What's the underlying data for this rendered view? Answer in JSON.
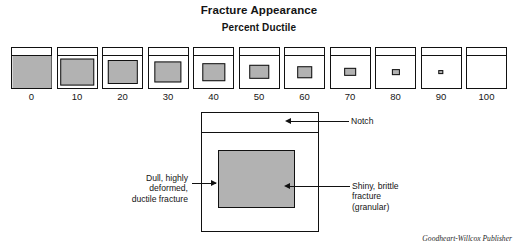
{
  "figure": {
    "main_title": "Fracture Appearance",
    "sub_title": "Percent Ductile",
    "credit": "Goodheart-Willcox Publisher"
  },
  "chart_data": {
    "type": "table",
    "title": "Fracture Appearance",
    "subtitle": "Percent Ductile",
    "xlabel": "Percent Ductile",
    "ylabel": "",
    "grid": false,
    "legend": "none",
    "categories": [
      "0",
      "10",
      "20",
      "30",
      "40",
      "50",
      "60",
      "70",
      "80",
      "90",
      "100"
    ],
    "values": [
      0,
      10,
      20,
      30,
      40,
      50,
      60,
      70,
      80,
      90,
      100
    ],
    "series": [
      {
        "name": "Brittle (shiny, granular) fracture area fraction",
        "values": [
          100,
          90,
          80,
          70,
          60,
          50,
          40,
          30,
          20,
          10,
          0
        ]
      },
      {
        "name": "Ductile (dull, deformed) fracture area fraction",
        "values": [
          0,
          10,
          20,
          30,
          40,
          50,
          60,
          70,
          80,
          90,
          100
        ]
      }
    ]
  },
  "scale": {
    "tick_labels": [
      "0",
      "10",
      "20",
      "30",
      "40",
      "50",
      "60",
      "70",
      "80",
      "90",
      "100"
    ],
    "specimens": [
      {
        "label": "0",
        "brittle_pct": 100,
        "inner_w": 100,
        "inner_h": 100,
        "full": true
      },
      {
        "label": "10",
        "brittle_pct": 90,
        "inner_w": 86,
        "inner_h": 84,
        "full": false
      },
      {
        "label": "20",
        "brittle_pct": 80,
        "inner_w": 78,
        "inner_h": 75,
        "full": false
      },
      {
        "label": "30",
        "brittle_pct": 70,
        "inner_w": 70,
        "inner_h": 66,
        "full": false
      },
      {
        "label": "40",
        "brittle_pct": 60,
        "inner_w": 60,
        "inner_h": 55,
        "full": false
      },
      {
        "label": "50",
        "brittle_pct": 50,
        "inner_w": 50,
        "inner_h": 45,
        "full": false
      },
      {
        "label": "60",
        "brittle_pct": 40,
        "inner_w": 40,
        "inner_h": 36,
        "full": false
      },
      {
        "label": "70",
        "brittle_pct": 30,
        "inner_w": 30,
        "inner_h": 26,
        "full": false
      },
      {
        "label": "80",
        "brittle_pct": 20,
        "inner_w": 21,
        "inner_h": 18,
        "full": false
      },
      {
        "label": "90",
        "brittle_pct": 10,
        "inner_w": 14,
        "inner_h": 12,
        "full": false
      },
      {
        "label": "100",
        "brittle_pct": 0,
        "inner_w": 0,
        "inner_h": 0,
        "full": false
      }
    ]
  },
  "detail": {
    "notch_label": "Notch",
    "ductile_label": "Dull, highly\ndeformed,\nductile fracture",
    "brittle_label": "Shiny, brittle\nfracture\n(granular)"
  },
  "colors": {
    "brittle_gray": "#b2b2b2",
    "outline": "#111111",
    "background": "#ffffff",
    "text": "#141414"
  }
}
